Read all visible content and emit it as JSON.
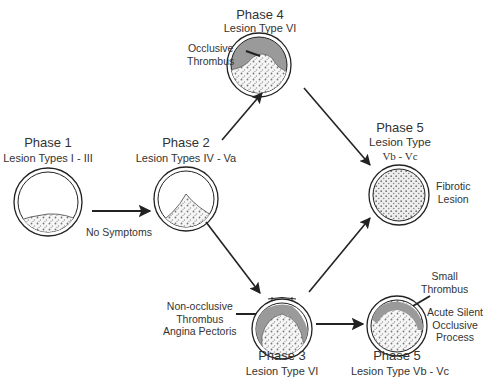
{
  "phases": {
    "p1": {
      "title": "Phase 1",
      "lesion": "Lesion Types I - III"
    },
    "p2": {
      "title": "Phase 2",
      "lesion": "Lesion Types IV - Va"
    },
    "p3": {
      "title": "Phase 3",
      "lesion": "Lesion Type VI"
    },
    "p4": {
      "title": "Phase 4",
      "lesion": "Lesion Type VI"
    },
    "p5a": {
      "title": "Phase 5",
      "lesion_line1": "Lesion Type",
      "lesion_line2": "Vb - Vc"
    },
    "p5b": {
      "title": "Phase 5",
      "lesion": "Lesion Type Vb - Vc"
    }
  },
  "annotations": {
    "no_symptoms": "No Symptoms",
    "occlusive_thrombus": [
      "Occlusive",
      "Thrombus"
    ],
    "fibrotic_lesion": [
      "Fibrotic",
      "Lesion"
    ],
    "non_occlusive": [
      "Non-occlusive",
      "Thrombus",
      "Angina Pectoris"
    ],
    "small_thrombus": [
      "Small",
      "Thrombus"
    ],
    "acute_silent": [
      "Acute Silent",
      "Occlusive",
      "Process"
    ]
  },
  "colors": {
    "line": "#222222",
    "thrombus": "#9a9a9a",
    "plaque_fill": "#f4f4f4",
    "plaque_dots": "#777777"
  }
}
